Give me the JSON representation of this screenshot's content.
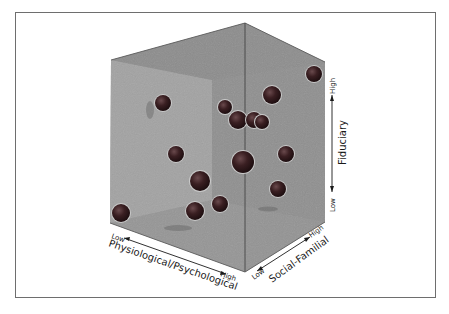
{
  "figure": {
    "type": "3d-scatter-cube",
    "axes": {
      "x": {
        "label": "Physiological/Psychological",
        "low": "Low",
        "high": "High"
      },
      "y": {
        "label": "Social-Familial",
        "low": "Low",
        "high": "High"
      },
      "z": {
        "label": "Fiduciary",
        "low": "Low",
        "high": "High"
      }
    },
    "colors": {
      "cube_face": "#8f8f8f",
      "cube_back_wall": "#a6a6a6",
      "sphere": "#3a1f22",
      "frame": "#6e6e6e"
    },
    "spheres": [
      {
        "cx": 314,
        "cy": 74,
        "r": 8
      },
      {
        "cx": 272,
        "cy": 95,
        "r": 9
      },
      {
        "cx": 163,
        "cy": 103,
        "r": 8
      },
      {
        "cx": 225,
        "cy": 107,
        "r": 7
      },
      {
        "cx": 238,
        "cy": 120,
        "r": 9
      },
      {
        "cx": 254,
        "cy": 120,
        "r": 8
      },
      {
        "cx": 262,
        "cy": 122,
        "r": 7
      },
      {
        "cx": 176,
        "cy": 154,
        "r": 8
      },
      {
        "cx": 243,
        "cy": 162,
        "r": 11
      },
      {
        "cx": 286,
        "cy": 154,
        "r": 8
      },
      {
        "cx": 200,
        "cy": 181,
        "r": 10
      },
      {
        "cx": 278,
        "cy": 189,
        "r": 8
      },
      {
        "cx": 121,
        "cy": 213,
        "r": 9
      },
      {
        "cx": 195,
        "cy": 211,
        "r": 9
      },
      {
        "cx": 220,
        "cy": 204,
        "r": 8
      }
    ]
  }
}
